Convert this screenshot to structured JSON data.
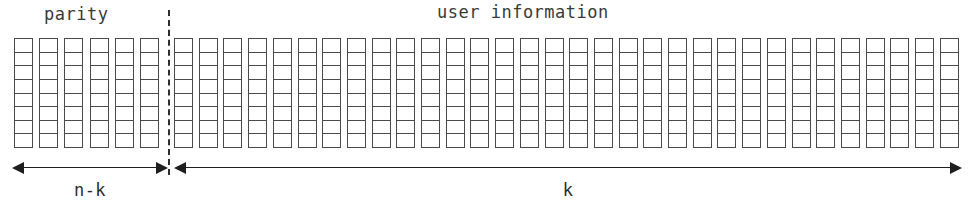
{
  "diagram": {
    "type": "codeword-structure",
    "width": 975,
    "height": 209,
    "background_color": "#ffffff",
    "line_color": "#4a4a4a",
    "arrow_color": "#1e1e1e",
    "text_color": "#3a3a3a"
  },
  "sections": {
    "parity": {
      "label": "parity",
      "column_count": 6,
      "cells_per_column": 8,
      "start_x": 14,
      "column_pitch": 25.2
    },
    "user_information": {
      "label": "user information",
      "column_count": 32,
      "cells_per_column": 8,
      "start_x": 174,
      "column_pitch": 24.7
    }
  },
  "divider": {
    "name": "section-divider",
    "style": "dashed",
    "x": 168
  },
  "dimensions": [
    {
      "id": "parity-span",
      "label": "n-k",
      "arrow": "double-headed",
      "from_x": 12,
      "to_x": 168
    },
    {
      "id": "userinfo-span",
      "label": "k",
      "arrow": "double-headed",
      "from_x": 174,
      "to_x": 962
    }
  ]
}
